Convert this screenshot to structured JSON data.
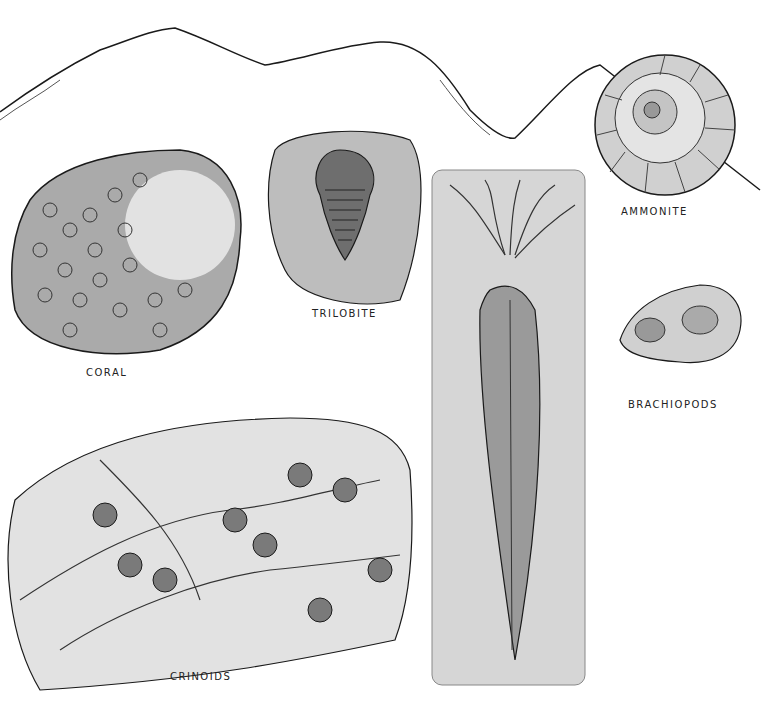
{
  "illustration": {
    "style": "pen-and-ink fossil plate, grayscale",
    "labels": {
      "ammonite": "AMMONITE",
      "brachiopods": "BRACHIOPODS",
      "trilobite": "TRILOBITE",
      "coral": "CORAL",
      "crinoids": "CRINOIDS"
    },
    "colors": {
      "ink": "#1a1a1a",
      "slab_light": "#e6e6e6",
      "slab_mid": "#c8c8c8",
      "slab_dark": "#8a8a8a",
      "background": "#ffffff"
    }
  }
}
